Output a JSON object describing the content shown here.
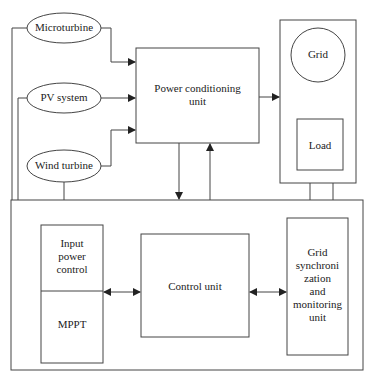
{
  "diagram": {
    "sources": [
      {
        "id": "microturbine",
        "label": "Microturbine"
      },
      {
        "id": "pv",
        "label": "PV system"
      },
      {
        "id": "wind",
        "label": "Wind turbine"
      }
    ],
    "pcu": {
      "line1": "Power conditioning",
      "line2": "unit"
    },
    "grid_panel": {
      "grid": "Grid",
      "load": "Load"
    },
    "control": {
      "input_power": [
        "Input",
        "power",
        "control"
      ],
      "mppt": "MPPT",
      "control_unit": "Control unit",
      "grid_sync": [
        "Grid",
        "synchroni",
        "zation",
        "and",
        "monitoring",
        "unit"
      ]
    },
    "colors": {
      "stroke": "#444444",
      "text": "#222222",
      "background": "#ffffff"
    }
  }
}
